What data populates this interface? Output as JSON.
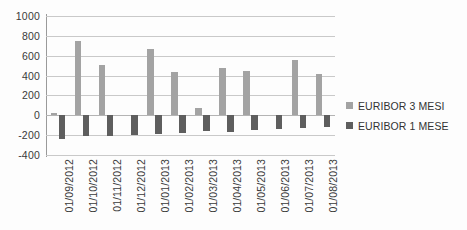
{
  "chart_data": {
    "type": "bar",
    "title": "",
    "subtitle": "",
    "xlabel": "",
    "ylabel": "",
    "ylim": [
      -400,
      1000
    ],
    "yticks": [
      1000,
      800,
      600,
      400,
      200,
      0,
      -200,
      -400
    ],
    "ytick_labels": [
      "1000",
      "800",
      "600",
      "400",
      "200",
      "0",
      "-200",
      "-400"
    ],
    "grid": true,
    "legend_position": "right",
    "orientation": "vertical",
    "categories": [
      "01/09/2012",
      "01/10/2012",
      "01/11/2012",
      "01/12/2012",
      "01/01/2013",
      "01/02/2013",
      "01/03/2013",
      "01/04/2013",
      "01/05/2013",
      "01/06/2013",
      "01/07/2013",
      "01/08/2013"
    ],
    "series": [
      {
        "name": "EURIBOR 3 MESI",
        "color": "#a3a3a3",
        "values": [
          20,
          750,
          510,
          0,
          670,
          440,
          70,
          480,
          445,
          0,
          555,
          420
        ]
      },
      {
        "name": "EURIBOR 1 MESE",
        "color": "#5e5e5e",
        "values": [
          -235,
          -210,
          -205,
          -195,
          -185,
          -180,
          -160,
          -165,
          -145,
          -135,
          -130,
          -120
        ]
      }
    ]
  },
  "legend": {
    "items": [
      {
        "label": "EURIBOR 3 MESI",
        "swatch": "legend-swatch-series-0"
      },
      {
        "label": "EURIBOR 1 MESE",
        "swatch": "legend-swatch-series-1"
      }
    ]
  },
  "colors": {
    "series_3_mesi": "#a3a3a3",
    "series_1_mese": "#5e5e5e",
    "gridline": "#c9c9c9",
    "axis": "#9a9a9a",
    "text": "#3a3a3a",
    "background": "#fdfdfd"
  }
}
